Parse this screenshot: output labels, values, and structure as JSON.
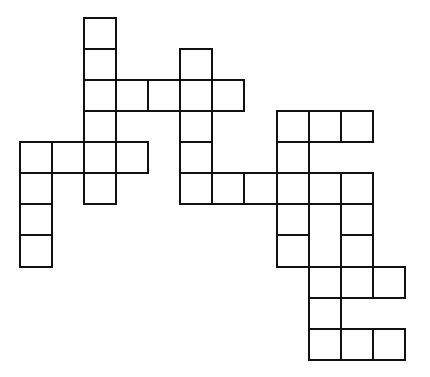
{
  "puzzle": {
    "type": "crossword-grid",
    "line_color": "#111111",
    "background": "#ffffff",
    "grid_origin": {
      "x": 20,
      "y": 18
    },
    "col_lefts": [
      20,
      52,
      84,
      116,
      148,
      180,
      212,
      244,
      277,
      309,
      341,
      373,
      405
    ],
    "row_tops": [
      18,
      49,
      80,
      111,
      142,
      173,
      204,
      235,
      267,
      298,
      329,
      360
    ],
    "cells": [
      [
        2,
        0
      ],
      [
        2,
        1
      ],
      [
        2,
        2
      ],
      [
        2,
        3
      ],
      [
        2,
        4
      ],
      [
        2,
        5
      ],
      [
        3,
        2
      ],
      [
        4,
        2
      ],
      [
        5,
        2
      ],
      [
        6,
        2
      ],
      [
        5,
        1
      ],
      [
        5,
        3
      ],
      [
        5,
        4
      ],
      [
        5,
        5
      ],
      [
        0,
        4
      ],
      [
        1,
        4
      ],
      [
        3,
        4
      ],
      [
        0,
        5
      ],
      [
        0,
        6
      ],
      [
        0,
        7
      ],
      [
        6,
        5
      ],
      [
        7,
        5
      ],
      [
        8,
        5
      ],
      [
        9,
        5
      ],
      [
        10,
        5
      ],
      [
        8,
        3
      ],
      [
        9,
        3
      ],
      [
        10,
        3
      ],
      [
        8,
        4
      ],
      [
        8,
        6
      ],
      [
        8,
        7
      ],
      [
        9,
        6
      ],
      [
        9,
        7
      ],
      [
        9,
        8
      ],
      [
        9,
        9
      ],
      [
        9,
        10
      ],
      [
        10,
        6
      ],
      [
        10,
        7
      ],
      [
        10,
        8
      ],
      [
        11,
        8
      ],
      [
        10,
        10
      ],
      [
        11,
        10
      ]
    ],
    "merged_no_divider": [
      {
        "col": 9,
        "between_rows": [
          6,
          7
        ]
      }
    ]
  }
}
